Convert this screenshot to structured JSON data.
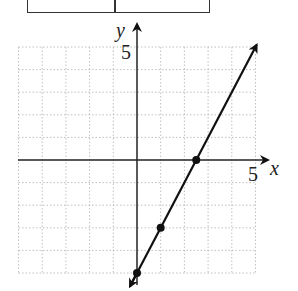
{
  "table": {
    "columns": 2,
    "cells": [
      "",
      ""
    ]
  },
  "axes": {
    "x_label": "x",
    "y_label": "y",
    "x_tick_label": "5",
    "y_tick_label": "5"
  },
  "colors": {
    "line": "#111111",
    "grid": "#b0b0b0",
    "axis": "#222222"
  },
  "chart_data": {
    "type": "line",
    "title": "",
    "xlabel": "x",
    "ylabel": "y",
    "xlim": [
      -5,
      5
    ],
    "ylim": [
      -5,
      5
    ],
    "grid": true,
    "equation": "y = 2x - 5",
    "series": [
      {
        "name": "line",
        "x": [
          0,
          1,
          2.5
        ],
        "y": [
          -5,
          -3,
          0
        ],
        "marked_points": [
          [
            0,
            -5
          ],
          [
            1,
            -3
          ],
          [
            2.5,
            0
          ]
        ],
        "extends_both_directions": true
      }
    ],
    "tick_labels": {
      "x": [
        "5"
      ],
      "y": [
        "5"
      ]
    }
  }
}
